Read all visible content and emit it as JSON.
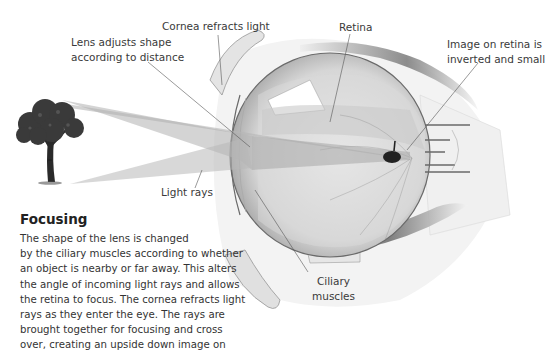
{
  "diagram": {
    "type": "anatomical-illustration",
    "labels": {
      "cornea": "Cornea refracts light",
      "lens_line1": "Lens adjusts shape",
      "lens_line2": "according to distance",
      "retina": "Retina",
      "image_line1": "Image on retina is",
      "image_line2": "inverted and small",
      "light_rays": "Light rays",
      "ciliary_line1": "Ciliary",
      "ciliary_line2": "muscles"
    },
    "colors": {
      "rays": "#b5b5b5",
      "eye_outline": "#6a6a6a",
      "tree_foliage": "#3a3a3a",
      "leader_line": "#555555"
    }
  },
  "text_block": {
    "heading": "Focusing",
    "lines": [
      "The shape of the lens is changed",
      "by the ciliary muscles according to whether",
      "an object is nearby or far away. This alters",
      "the angle of incoming light rays and allows",
      "the retina to focus. The cornea refracts light",
      "rays as they enter the eye. The rays are",
      "brought together for focusing and cross",
      "over, creating an upside down image on"
    ]
  }
}
